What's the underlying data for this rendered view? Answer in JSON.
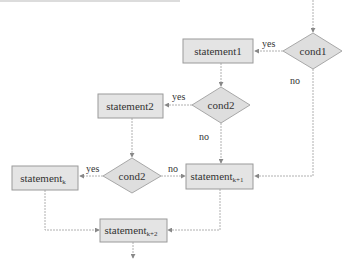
{
  "colors": {
    "box_fill": "#e4e4e4",
    "box_stroke": "#9a9a9a",
    "diamond_fill": "#dedede",
    "diamond_stroke": "#a8a8a8",
    "line": "#b0b0b0",
    "arrow": "#888888",
    "text": "#333333"
  },
  "nodes": {
    "cond1": {
      "label": "cond1"
    },
    "statement1": {
      "label": "statement1"
    },
    "cond2_top": {
      "label": "cond2"
    },
    "statement2": {
      "label": "statement2"
    },
    "cond2_bottom": {
      "label": "cond2"
    },
    "statement_k": {
      "label": "statement",
      "sub": "k"
    },
    "statement_k1": {
      "label": "statement",
      "sub": "k+1"
    },
    "statement_k2": {
      "label": "statement",
      "sub": "k+2"
    }
  },
  "edge_labels": {
    "cond1_yes": "yes",
    "cond1_no": "no",
    "cond2_top_yes": "yes",
    "cond2_top_no": "no",
    "cond2_bottom_yes": "yes",
    "cond2_bottom_no": "no"
  }
}
